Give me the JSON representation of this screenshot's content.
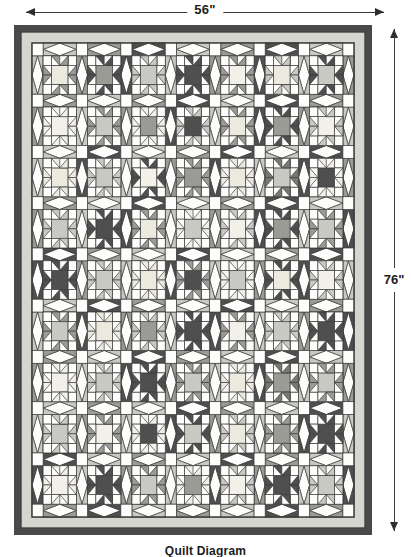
{
  "diagram": {
    "caption": "Quilt Diagram",
    "width_label": "56\"",
    "height_label": "76\"",
    "icon_arrow_left": "arrow-left-icon",
    "icon_arrow_right": "arrow-right-icon",
    "icon_arrow_up": "arrow-up-icon",
    "icon_arrow_down": "arrow-down-icon"
  },
  "colors": {
    "binding": "#4a4a4a",
    "inner_border": "#d6d6d0",
    "background": "#fdfdfb",
    "outline": "#3c3c3c",
    "light": "#f2f0e8",
    "dotted_light": "#eceadf",
    "medium_light": "#c9c9c4",
    "medium": "#9b9b96",
    "medium_dark": "#787873",
    "dark": "#4f4f4f"
  },
  "quilt": {
    "columns": 7,
    "rows": 9,
    "block_kinds": [
      "sawtooth-star",
      "square-in-square"
    ],
    "star_fabrics": [
      [
        "medium",
        "dark",
        "medium_light",
        "dark",
        "medium",
        "medium_light",
        "dark"
      ],
      [
        "light",
        "medium",
        "light",
        "medium_light",
        "medium",
        "dark",
        "medium_light"
      ],
      [
        "dotted_light",
        "medium_light",
        "dark",
        "medium",
        "dotted_light",
        "medium_dark",
        "light"
      ],
      [
        "medium_light",
        "dark",
        "medium",
        "light",
        "medium_light",
        "dark",
        "medium"
      ],
      [
        "dark",
        "medium_light",
        "dotted_light",
        "medium",
        "light",
        "dark",
        "medium_light"
      ],
      [
        "medium",
        "dotted_light",
        "medium_light",
        "dark",
        "medium",
        "medium_light",
        "dark"
      ],
      [
        "light",
        "medium_light",
        "dark",
        "medium",
        "dotted_light",
        "medium_dark",
        "medium"
      ],
      [
        "medium_light",
        "medium",
        "light",
        "dark",
        "medium_light",
        "medium",
        "dark"
      ],
      [
        "light",
        "dark",
        "medium",
        "light",
        "medium_light",
        "dark",
        "medium_light"
      ]
    ],
    "star_centers": [
      [
        "dotted_light",
        "medium",
        "medium_light",
        "dark",
        "light",
        "dotted_light",
        "medium_light"
      ],
      [
        "light",
        "medium_light",
        "medium",
        "dark",
        "dotted_light",
        "medium",
        "light"
      ],
      [
        "dotted_light",
        "medium_light",
        "light",
        "medium",
        "dotted_light",
        "medium_light",
        "dark"
      ],
      [
        "medium_light",
        "dark",
        "dotted_light",
        "medium_light",
        "light",
        "medium",
        "medium_light"
      ],
      [
        "dark",
        "medium_light",
        "dotted_light",
        "dark",
        "medium_light",
        "dotted_light",
        "light"
      ],
      [
        "medium_light",
        "dotted_light",
        "medium",
        "dark",
        "light",
        "medium_light",
        "dark"
      ],
      [
        "light",
        "medium_light",
        "dark",
        "medium_light",
        "dotted_light",
        "medium",
        "medium_light"
      ],
      [
        "medium_light",
        "light",
        "dark",
        "medium_light",
        "dotted_light",
        "medium",
        "dark"
      ],
      [
        "light",
        "dark",
        "medium_light",
        "medium",
        "light",
        "dark",
        "medium_light"
      ]
    ],
    "sashing_corner_fabrics": [
      [
        "medium_light",
        "medium",
        "dark",
        "medium_light",
        "medium",
        "dark",
        "medium_light",
        "medium"
      ],
      [
        "medium",
        "medium_light",
        "medium",
        "dark",
        "medium_light",
        "dark",
        "medium",
        "medium_light"
      ],
      [
        "medium_light",
        "dark",
        "medium_light",
        "medium",
        "dark",
        "medium_light",
        "dark",
        "medium"
      ],
      [
        "medium",
        "medium_light",
        "dark",
        "medium_light",
        "medium",
        "dark",
        "medium_light",
        "dark"
      ],
      [
        "dark",
        "medium",
        "medium_light",
        "dark",
        "medium_light",
        "medium",
        "dark",
        "medium_light"
      ],
      [
        "medium_light",
        "dark",
        "medium",
        "medium_light",
        "dark",
        "medium_light",
        "medium",
        "dark"
      ],
      [
        "medium",
        "medium_light",
        "dark",
        "medium",
        "medium_light",
        "dark",
        "medium_light",
        "medium"
      ],
      [
        "medium_light",
        "medium",
        "medium_light",
        "dark",
        "medium",
        "medium_light",
        "dark",
        "medium_light"
      ],
      [
        "dark",
        "medium_light",
        "medium",
        "medium_light",
        "dark",
        "medium",
        "medium_light",
        "dark"
      ],
      [
        "medium",
        "dark",
        "medium_light",
        "medium",
        "medium_light",
        "dark",
        "medium",
        "medium_light"
      ]
    ]
  }
}
